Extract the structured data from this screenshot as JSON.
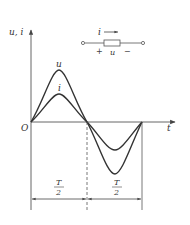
{
  "diagram": {
    "title": "",
    "axes": {
      "y_label": "u, i",
      "x_label": "t",
      "origin_label": "O"
    },
    "curves": [
      {
        "name": "u",
        "label": "u",
        "amplitude_px": 52,
        "type": "sine"
      },
      {
        "name": "i",
        "label": "i",
        "amplitude_px": 28,
        "type": "sine"
      }
    ],
    "dimensions": [
      {
        "label_num": "T",
        "label_den": "2",
        "from": "O",
        "to": "half-period"
      },
      {
        "label_num": "T",
        "label_den": "2",
        "from": "half-period",
        "to": "period"
      }
    ],
    "circuit": {
      "current_label": "i",
      "voltage_label": "u",
      "plus_sign": "+",
      "minus_sign": "−",
      "element": "resistor"
    }
  }
}
